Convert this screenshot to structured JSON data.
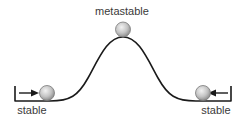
{
  "diagram": {
    "labels": {
      "top": "metastable",
      "left": "stable",
      "right": "stable"
    },
    "colors": {
      "line": "#1a1a1a",
      "ball_light": "#eeeeee",
      "ball_dark": "#9a9a9a",
      "ball_stroke": "#7a7a7a",
      "text": "#3a3a3a"
    },
    "elements": [
      {
        "type": "curve",
        "description": "energy landscape: two wells and one hilltop"
      },
      {
        "type": "ball",
        "position": "left-well",
        "state": "stable"
      },
      {
        "type": "ball",
        "position": "hilltop",
        "state": "metastable"
      },
      {
        "type": "ball",
        "position": "right-well",
        "state": "stable"
      },
      {
        "type": "arrow",
        "position": "left",
        "direction": "right"
      },
      {
        "type": "arrow",
        "position": "right",
        "direction": "left"
      }
    ]
  }
}
